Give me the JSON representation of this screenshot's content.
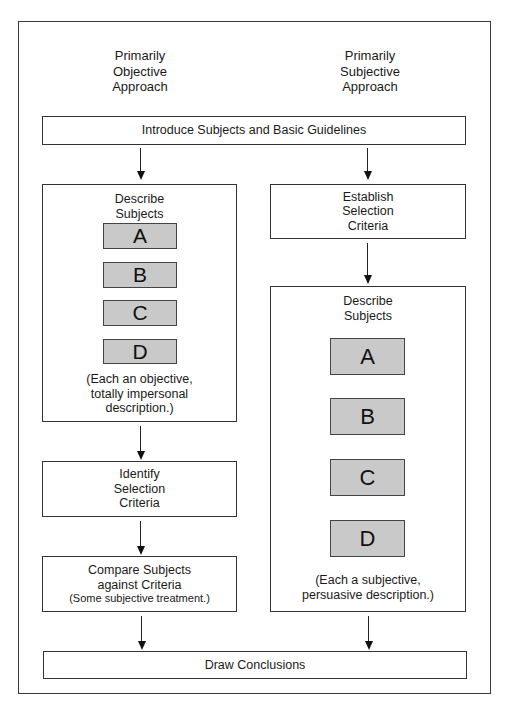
{
  "diagram": {
    "columns": {
      "left_heading": [
        "Primarily",
        "Objective",
        "Approach"
      ],
      "right_heading": [
        "Primarily",
        "Subjective",
        "Approach"
      ]
    },
    "intro_box": {
      "label": "Introduce Subjects and Basic Guidelines"
    },
    "left_column": {
      "describe_box": {
        "title": [
          "Describe",
          "Subjects"
        ],
        "subjects": [
          "A",
          "B",
          "C",
          "D"
        ],
        "note": [
          "(Each an objective,",
          "totally impersonal",
          "description.)"
        ]
      },
      "identify_box": {
        "label": [
          "Identify",
          "Selection",
          "Criteria"
        ]
      },
      "compare_box": {
        "label": [
          "Compare Subjects",
          "against Criteria"
        ],
        "note": "(Some subjective treatment.)"
      }
    },
    "right_column": {
      "establish_box": {
        "label": [
          "Establish",
          "Selection",
          "Criteria"
        ]
      },
      "describe_box": {
        "title": [
          "Describe",
          "Subjects"
        ],
        "subjects": [
          "A",
          "B",
          "C",
          "D"
        ],
        "note": [
          "(Each a subjective,",
          "persuasive description.)"
        ]
      }
    },
    "conclusion_box": {
      "label": "Draw Conclusions"
    },
    "colors": {
      "border": "#333333",
      "subject_fill": "#c9c9c9",
      "background": "#ffffff"
    }
  }
}
